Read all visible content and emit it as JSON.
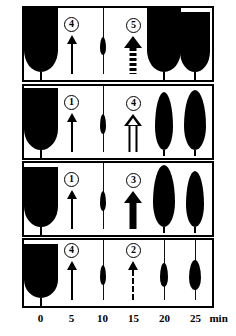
{
  "figure": {
    "title": "",
    "unit_label": "min",
    "x_axis": {
      "ticks": [
        0,
        5,
        10,
        15,
        20,
        25
      ],
      "tick_labels": [
        "0",
        "5",
        "10",
        "15",
        "20",
        "25"
      ],
      "unit": "min",
      "range": [
        -3,
        28
      ]
    },
    "rows": [
      {
        "row_id": "row-1",
        "markers": [
          {
            "time": 5,
            "number": "4",
            "arrow_style": "thin-solid"
          },
          {
            "time": 15,
            "number": "5",
            "arrow_style": "thick-dotted"
          }
        ],
        "shapes": [
          {
            "time": 0,
            "kind": "u-blob",
            "width": 34,
            "height": 64,
            "tail": 8
          },
          {
            "time": 10,
            "kind": "spindle",
            "width": 6,
            "height": 18,
            "tail": 0
          },
          {
            "time": 20,
            "kind": "u-blob",
            "width": 34,
            "height": 64,
            "tail": 8
          },
          {
            "time": 25,
            "kind": "u-blob",
            "width": 30,
            "height": 60,
            "tail": 8
          }
        ]
      },
      {
        "row_id": "row-2",
        "markers": [
          {
            "time": 5,
            "number": "1",
            "arrow_style": "thin-solid"
          },
          {
            "time": 15,
            "number": "4",
            "arrow_style": "hollow"
          }
        ],
        "shapes": [
          {
            "time": 0,
            "kind": "u-blob",
            "width": 34,
            "height": 62,
            "tail": 8
          },
          {
            "time": 10,
            "kind": "spindle",
            "width": 6,
            "height": 20,
            "tail": 0
          },
          {
            "time": 20,
            "kind": "leaf",
            "width": 18,
            "height": 58,
            "tail": 6
          },
          {
            "time": 25,
            "kind": "leaf",
            "width": 22,
            "height": 60,
            "tail": 6
          }
        ]
      },
      {
        "row_id": "row-3",
        "markers": [
          {
            "time": 5,
            "number": "1",
            "arrow_style": "thin-solid"
          },
          {
            "time": 15,
            "number": "3",
            "arrow_style": "thick-solid"
          }
        ],
        "shapes": [
          {
            "time": 0,
            "kind": "u-blob",
            "width": 34,
            "height": 60,
            "tail": 8
          },
          {
            "time": 10,
            "kind": "spindle",
            "width": 6,
            "height": 20,
            "tail": 0
          },
          {
            "time": 20,
            "kind": "leaf",
            "width": 22,
            "height": 62,
            "tail": 6
          },
          {
            "time": 25,
            "kind": "leaf",
            "width": 18,
            "height": 56,
            "tail": 6
          }
        ]
      },
      {
        "row_id": "row-4",
        "markers": [
          {
            "time": 5,
            "number": "4",
            "arrow_style": "thin-solid"
          },
          {
            "time": 15,
            "number": "2",
            "arrow_style": "thin-dashed"
          }
        ],
        "shapes": [
          {
            "time": 0,
            "kind": "u-blob",
            "width": 34,
            "height": 54,
            "tail": 8
          },
          {
            "time": 10,
            "kind": "spindle",
            "width": 6,
            "height": 20,
            "tail": 0
          },
          {
            "time": 20,
            "kind": "spindle",
            "width": 8,
            "height": 24,
            "tail": 0
          },
          {
            "time": 25,
            "kind": "spindle",
            "width": 12,
            "height": 30,
            "tail": 0
          }
        ]
      }
    ]
  },
  "colors": {
    "ink": "#000000",
    "paper": "#ffffff"
  }
}
